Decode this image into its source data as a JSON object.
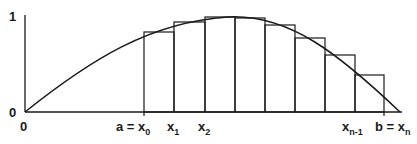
{
  "diagram": {
    "type": "riemann-sum",
    "colors": {
      "stroke": "#1a1a1a",
      "background": "#ffffff"
    },
    "axes": {
      "y_tick_labels": [
        "0",
        "1"
      ],
      "x_origin_label": "0"
    },
    "partition_labels": [
      {
        "main": "a = x",
        "sub": "0",
        "x": 144
      },
      {
        "main": "x",
        "sub": "1",
        "x": 174
      },
      {
        "main": "x",
        "sub": "2",
        "x": 205
      },
      {
        "main": "x",
        "sub": "n-1",
        "x": 355
      },
      {
        "main": "b = x",
        "sub": "n",
        "x": 384
      }
    ],
    "partition_x": [
      144,
      174,
      205,
      235,
      265,
      295,
      325,
      355,
      384
    ],
    "rect_tops": [
      32,
      22,
      17,
      18,
      25,
      38,
      55,
      75
    ]
  }
}
